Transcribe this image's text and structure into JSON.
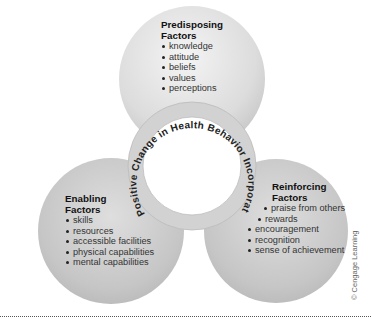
{
  "diagram": {
    "center_ring_text": "Positive Change in Health Behavior Incorporates...",
    "predisposing": {
      "title_line1": "Predisposing",
      "title_line2": "Factors",
      "items": [
        "knowledge",
        "attitude",
        "beliefs",
        "values",
        "perceptions"
      ]
    },
    "enabling": {
      "title_line1": "Enabling",
      "title_line2": "Factors",
      "items": [
        "skills",
        "resources",
        "accessible facilities",
        "physical capabilities",
        "mental capabilities"
      ]
    },
    "reinforcing": {
      "title_line1": "Reinforcing",
      "title_line2": "Factors",
      "items": [
        "praise from others",
        "rewards",
        "encouragement",
        "recognition",
        "sense of achievement"
      ]
    },
    "copyright": "© Cengage Learning",
    "colors": {
      "circle_light": "#eeeeee",
      "circle_mid": "#c8c8c8",
      "ring": "#d4d4d4",
      "text": "#222222"
    }
  }
}
